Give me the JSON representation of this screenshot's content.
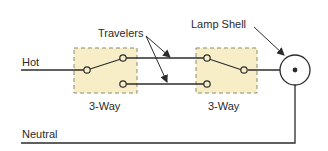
{
  "diagram": {
    "labels": {
      "hot": "Hot",
      "neutral": "Neutral",
      "travelers": "Travelers",
      "lamp_shell": "Lamp Shell",
      "switch_left": "3-Way",
      "switch_right": "3-Way"
    },
    "colors": {
      "wire": "#2b2b2b",
      "switch_box_fill": "#f7eec8",
      "switch_box_border": "#8a8a80",
      "background": "#ffffff"
    },
    "components": [
      {
        "id": "switch-1",
        "type": "3-way switch",
        "label": "3-Way"
      },
      {
        "id": "switch-2",
        "type": "3-way switch",
        "label": "3-Way"
      },
      {
        "id": "lamp",
        "type": "lamp",
        "label": "Lamp Shell"
      }
    ],
    "wires": [
      "Hot",
      "Traveler 1",
      "Traveler 2",
      "Neutral"
    ]
  }
}
